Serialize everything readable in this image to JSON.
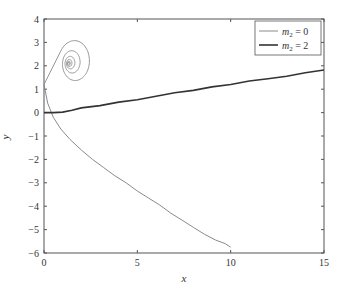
{
  "chart_data": {
    "type": "line",
    "title": "",
    "xlabel": "x",
    "ylabel": "y",
    "xlim": [
      0,
      15
    ],
    "ylim": [
      -6,
      4
    ],
    "xticks": [
      0,
      5,
      10,
      15
    ],
    "yticks": [
      -6,
      -5,
      -4,
      -3,
      -2,
      -1,
      0,
      1,
      2,
      3,
      4
    ],
    "grid": false,
    "legend_position": "upper right",
    "series": [
      {
        "name": "m2 = 0",
        "label_var": "m",
        "label_sub": "2",
        "label_rest": " = 0",
        "color": "#8a8a8a",
        "x": [
          0.0,
          0.2,
          0.5,
          0.9,
          1.4,
          2.0,
          2.6,
          3.2,
          3.8,
          4.4,
          5.0,
          5.6,
          6.2,
          6.8,
          7.4,
          8.0,
          8.6,
          9.2,
          9.7,
          10.0
        ],
        "y": [
          1.2,
          0.4,
          -0.2,
          -0.7,
          -1.15,
          -1.6,
          -2.0,
          -2.35,
          -2.7,
          -3.0,
          -3.35,
          -3.65,
          -3.95,
          -4.3,
          -4.6,
          -4.9,
          -5.2,
          -5.45,
          -5.6,
          -5.75
        ],
        "spiral": {
          "start": [
            0.0,
            1.2
          ],
          "center": [
            1.3,
            2.1
          ],
          "note": "trajectory spirals inward toward approximately (1.3, 2.1); outer loop reaches x≈1.9, y≈2.9 and x≈0.1, y≈0.9"
        }
      },
      {
        "name": "m2 = 2",
        "label_var": "m",
        "label_sub": "2",
        "label_rest": " = 2",
        "color": "#333333",
        "x": [
          0.0,
          0.5,
          1.0,
          1.5,
          2.0,
          3.0,
          4.0,
          5.0,
          6.0,
          7.0,
          8.0,
          9.0,
          10.0,
          11.0,
          12.0,
          13.0,
          14.0,
          15.0
        ],
        "y": [
          0.0,
          0.0,
          0.02,
          0.1,
          0.2,
          0.3,
          0.45,
          0.55,
          0.7,
          0.85,
          0.95,
          1.1,
          1.2,
          1.35,
          1.45,
          1.55,
          1.7,
          1.82
        ]
      }
    ]
  }
}
